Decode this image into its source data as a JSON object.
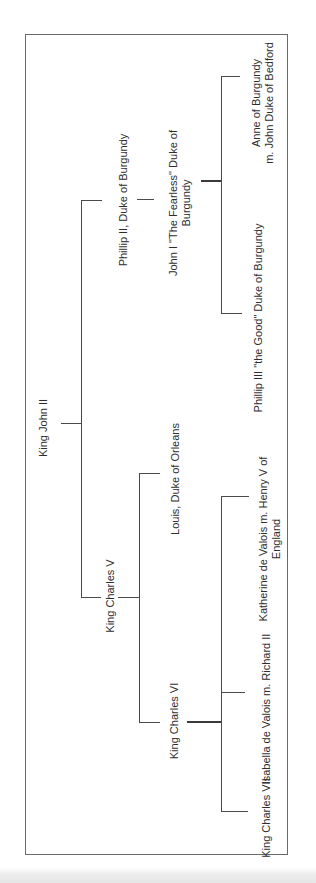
{
  "diagram": {
    "type": "family-tree",
    "orientation": "rotated-90-ccw",
    "nodes": {
      "king_john_ii": {
        "label": "King John II"
      },
      "phillip_ii": {
        "label": "Phillip II, Duke of Burgundy"
      },
      "john_i": {
        "line1": "John I \"The Fearless\" Duke of",
        "line2": "Burgundy"
      },
      "anne": {
        "line1": "Anne of Burgundy",
        "line2": "m. John Duke of  Bedford"
      },
      "phillip_iii": {
        "label": "Phillip III \"the Good\" Duke of Burgundy"
      },
      "charles_v": {
        "label": "King Charles V"
      },
      "louis": {
        "label": "Louis, Duke of Orleans"
      },
      "charles_vi": {
        "label": "King Charles VI"
      },
      "katherine": {
        "line1": "Katherine de Valois m. Henry V of",
        "line2": "England"
      },
      "isabella": {
        "label": "Isabella de Valois m. Richard II"
      },
      "charles_vii": {
        "label": "King Charles VII"
      }
    },
    "edges": [
      {
        "from": "King John II",
        "to": "Phillip II, Duke of Burgundy"
      },
      {
        "from": "King John II",
        "to": "King Charles V"
      },
      {
        "from": "Phillip II, Duke of Burgundy",
        "to": "John I \"The Fearless\" Duke of Burgundy"
      },
      {
        "from": "John I \"The Fearless\" Duke of Burgundy",
        "to": "Anne of Burgundy m. John Duke of Bedford"
      },
      {
        "from": "John I \"The Fearless\" Duke of Burgundy",
        "to": "Phillip III \"the Good\" Duke of Burgundy"
      },
      {
        "from": "King Charles V",
        "to": "Louis, Duke of Orleans"
      },
      {
        "from": "King Charles V",
        "to": "King Charles VI"
      },
      {
        "from": "King Charles VI",
        "to": "Katherine de Valois m. Henry V of England"
      },
      {
        "from": "King Charles VI",
        "to": "Isabella de Valois m. Richard II"
      },
      {
        "from": "King Charles VI",
        "to": "King Charles VII"
      }
    ]
  }
}
